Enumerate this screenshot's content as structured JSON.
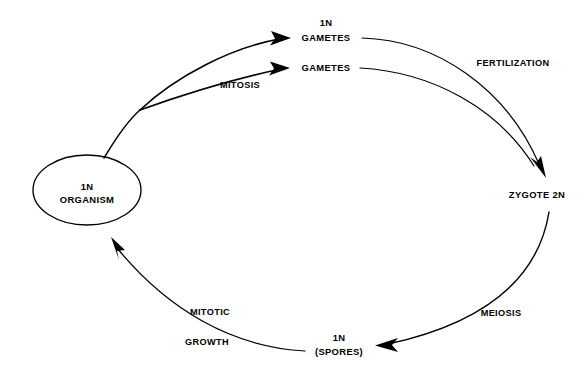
{
  "diagram": {
    "background_color": "#ffffff",
    "line_color": "#000000",
    "text_color": "#000000",
    "nodes": [
      {
        "id": "organism",
        "shape": "ellipse",
        "line1": "1N",
        "line2": "ORGANISM",
        "cx": 87,
        "cy": 190,
        "rx": 54,
        "ry": 35
      },
      {
        "id": "gametes_upper",
        "shape": "text",
        "line1": "1N",
        "line2": "GAMETES",
        "x": 326,
        "y1": 26,
        "y2": 41
      },
      {
        "id": "gametes_lower",
        "shape": "text",
        "line1": "",
        "line2": "GAMETES",
        "x": 326,
        "y1": 0,
        "y2": 71
      },
      {
        "id": "zygote",
        "shape": "text",
        "line1": "",
        "line2": "ZYGOTE 2N",
        "x": 537,
        "y1": 0,
        "y2": 198
      },
      {
        "id": "spores",
        "shape": "text",
        "line1": "1N",
        "line2": "(SPORES)",
        "x": 339,
        "y1": 341,
        "y2": 355
      }
    ],
    "process_labels": [
      {
        "id": "mitosis",
        "text": "MITOSIS",
        "x": 240,
        "y": 88
      },
      {
        "id": "fertilization",
        "text": "FERTILIZATION",
        "x": 513,
        "y": 66
      },
      {
        "id": "meiosis",
        "text": "MEIOSIS",
        "x": 501,
        "y": 316
      },
      {
        "id": "mitotic",
        "text": "MITOTIC",
        "x": 210,
        "y": 315
      },
      {
        "id": "growth",
        "text": "GROWTH",
        "x": 207,
        "y": 345
      }
    ],
    "connectors": [
      {
        "id": "organism-to-gametes-upper",
        "from": "organism",
        "to": "gametes_upper",
        "arrowhead": true
      },
      {
        "id": "organism-to-gametes-lower",
        "from": "organism",
        "to": "gametes_lower",
        "arrowhead": true
      },
      {
        "id": "gametes-upper-to-zygote",
        "from": "gametes_upper",
        "to": "zygote",
        "arrowhead": true
      },
      {
        "id": "gametes-lower-to-zygote",
        "from": "gametes_lower",
        "to": "zygote",
        "arrowhead": true
      },
      {
        "id": "zygote-to-spores",
        "from": "zygote",
        "to": "spores",
        "arrowhead": true
      },
      {
        "id": "spores-to-organism",
        "from": "spores",
        "to": "organism",
        "arrowhead": true
      }
    ]
  }
}
